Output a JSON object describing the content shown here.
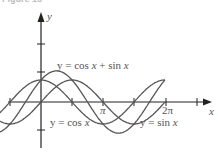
{
  "caption": "Figure 15",
  "chart_data": {
    "type": "line",
    "title": "",
    "xlabel": "x",
    "ylabel": "y",
    "x_ticks": [
      "π",
      "2π"
    ],
    "series": [
      {
        "name": "y = cos x",
        "function": "cos(x)",
        "x_range": [
          -3.14,
          6.28
        ]
      },
      {
        "name": "y = sin x",
        "function": "sin(x)",
        "x_range": [
          -3.14,
          6.28
        ]
      },
      {
        "name": "y = cos x + sin x",
        "function": "cos(x)+sin(x)",
        "x_range": [
          -3.14,
          6.28
        ]
      }
    ],
    "annotations": [
      "y = cos x + sin x",
      "y = cos x",
      "y = sin x"
    ],
    "grid": false
  },
  "labels": {
    "y_axis": "y",
    "x_axis": "x",
    "pi": "π",
    "two_pi": "2π",
    "sum_prefix": "y = cos ",
    "sum_x1": "x",
    "sum_mid": " + sin ",
    "sum_x2": "x",
    "cos_prefix": "y = cos ",
    "cos_x": "x",
    "sin_prefix": "y = sin ",
    "sin_x": "x"
  },
  "colors": {
    "axis": "#222222",
    "curve": "#555555"
  }
}
